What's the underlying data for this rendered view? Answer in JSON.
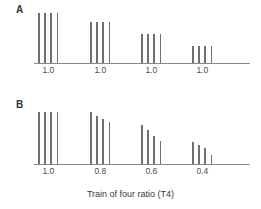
{
  "figure": {
    "background_color": "#ffffff",
    "bar_color": "#707070",
    "axis_color": "#8a8a8a",
    "text_color": "#3a3a3a",
    "x_axis_title": "Train of four ratio (T4)"
  },
  "panels": [
    {
      "letter": "A",
      "tick_labels": [
        "1.0",
        "1.0",
        "1.0",
        "1.0"
      ],
      "groups": [
        {
          "label": "1.0",
          "values": [
            1.0,
            1.0,
            1.0,
            1.0
          ]
        },
        {
          "label": "1.0",
          "values": [
            0.83,
            0.83,
            0.83,
            0.83
          ]
        },
        {
          "label": "1.0",
          "values": [
            0.58,
            0.58,
            0.58,
            0.58
          ]
        },
        {
          "label": "1.0",
          "values": [
            0.35,
            0.35,
            0.35,
            0.35
          ]
        }
      ]
    },
    {
      "letter": "B",
      "tick_labels": [
        "1.0",
        "0.8",
        "0.6",
        "0.4"
      ],
      "groups": [
        {
          "label": "1.0",
          "values": [
            1.0,
            1.0,
            1.0,
            1.0
          ]
        },
        {
          "label": "0.8",
          "values": [
            1.0,
            0.93,
            0.87,
            0.8
          ]
        },
        {
          "label": "0.6",
          "values": [
            0.75,
            0.66,
            0.53,
            0.45
          ]
        },
        {
          "label": "0.4",
          "values": [
            0.42,
            0.36,
            0.3,
            0.17
          ]
        }
      ]
    }
  ],
  "chart_data": {
    "type": "bar",
    "title": "",
    "subtitle": "",
    "xlabel": "Train of four ratio (T4)",
    "ylabel": "",
    "grid": false,
    "legend": "none",
    "ylim": [
      0,
      1.0
    ],
    "panels": [
      {
        "name": "A",
        "categories": [
          "1.0",
          "1.0",
          "1.0",
          "1.0"
        ],
        "series": [
          {
            "name": "Twitch 1",
            "values": [
              1.0,
              0.83,
              0.58,
              0.35
            ]
          },
          {
            "name": "Twitch 2",
            "values": [
              1.0,
              0.83,
              0.58,
              0.35
            ]
          },
          {
            "name": "Twitch 3",
            "values": [
              1.0,
              0.83,
              0.58,
              0.35
            ]
          },
          {
            "name": "Twitch 4",
            "values": [
              1.0,
              0.83,
              0.58,
              0.35
            ]
          }
        ]
      },
      {
        "name": "B",
        "categories": [
          "1.0",
          "0.8",
          "0.6",
          "0.4"
        ],
        "series": [
          {
            "name": "Twitch 1",
            "values": [
              1.0,
              1.0,
              0.75,
              0.42
            ]
          },
          {
            "name": "Twitch 2",
            "values": [
              1.0,
              0.93,
              0.66,
              0.36
            ]
          },
          {
            "name": "Twitch 3",
            "values": [
              1.0,
              0.87,
              0.53,
              0.3
            ]
          },
          {
            "name": "Twitch 4",
            "values": [
              1.0,
              0.8,
              0.45,
              0.17
            ]
          }
        ]
      }
    ]
  }
}
